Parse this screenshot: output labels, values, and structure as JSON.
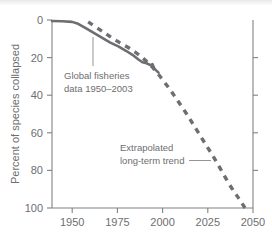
{
  "chart_data": {
    "type": "line",
    "title": "",
    "xlabel": "",
    "ylabel": "Percent of species collapsed",
    "xlim": [
      1950,
      2050
    ],
    "ylim": [
      0,
      100
    ],
    "y_inverted": true,
    "grid": false,
    "legend": "none",
    "xticks": [
      1950,
      1975,
      2000,
      2025,
      2050
    ],
    "xtick_labels": [
      "1950",
      "1975",
      "2000",
      "2025",
      "2050"
    ],
    "yticks": [
      0,
      20,
      40,
      60,
      80,
      100
    ],
    "ytick_labels": [
      "0",
      "20",
      "40",
      "60",
      "80",
      "100"
    ],
    "series": [
      {
        "name": "Global fisheries data 1950-2003",
        "style": "solid",
        "color": "#6d6e71",
        "x": [
          1950,
          1955,
          1960,
          1963,
          1967,
          1971,
          1975,
          1979,
          1983,
          1987,
          1990,
          1993,
          1995,
          1997,
          1999,
          2000,
          2001,
          2003
        ],
        "y": [
          0.5,
          0.7,
          1.0,
          2.0,
          4.5,
          7.0,
          9.5,
          12.0,
          14.0,
          16.5,
          18.5,
          21.0,
          22.5,
          23.0,
          24.0,
          23.5,
          26.0,
          28.0
        ]
      },
      {
        "name": "Extrapolated long-term trend",
        "style": "dashed",
        "color": "#6d6e71",
        "x": [
          1968,
          1975,
          1982,
          1990,
          1997,
          2003,
          2010,
          2017,
          2024,
          2031,
          2038,
          2043,
          2046
        ],
        "y": [
          1.0,
          6.0,
          11.0,
          16.0,
          22.0,
          29.0,
          39.0,
          50.0,
          62.0,
          74.0,
          87.0,
          95.0,
          100.0
        ]
      }
    ],
    "annotations": [
      {
        "id": "fisheries-annotation",
        "line1": "Global fisheries",
        "line2": "data 1950–2003",
        "leader": "vertical"
      },
      {
        "id": "extrapolated-annotation",
        "line1": "Extrapolated",
        "line2": "long-term trend",
        "leader": "horizontal"
      }
    ]
  }
}
